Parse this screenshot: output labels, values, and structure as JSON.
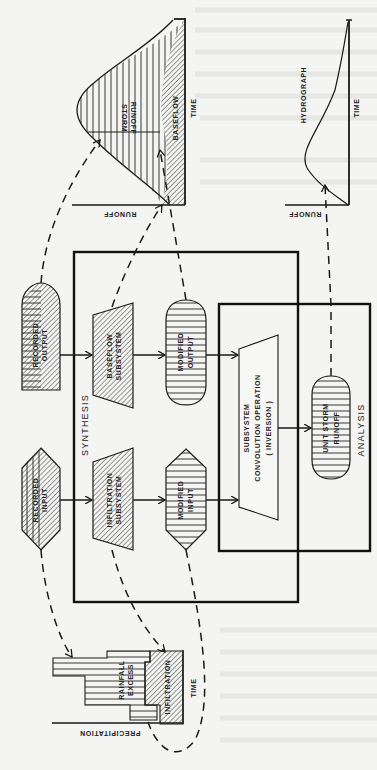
{
  "diagram": {
    "type": "flow diagram (rotated 90° clockwise)",
    "orientation": "rotated-90-cw",
    "colors": {
      "ink": "#1a1a1a",
      "paper": "#f4f4f2",
      "bleed_text": "#d8d8d4"
    },
    "groups": {
      "synthesis": {
        "label": "SYNTHESIS"
      },
      "analysis": {
        "label": "ANALYSIS"
      }
    },
    "nodes": {
      "recorded_output": {
        "line1": "RECORDED",
        "line2": "OUTPUT",
        "shape": "capsule",
        "fill": "horizontal lines + diagonal hatch"
      },
      "recorded_input": {
        "line1": "RECORDED",
        "line2": "INPUT",
        "shape": "hexagon",
        "fill": "vertical lines + diagonal hatch"
      },
      "baseflow_subsystem": {
        "line1": "BASEFLOW",
        "line2": "SUBSYSTEM",
        "shape": "trapezoid",
        "fill": "diagonal hatch"
      },
      "infiltration_subsystem": {
        "line1": "INFILTRATION",
        "line2": "SUBSYSTEM",
        "shape": "trapezoid",
        "fill": "diagonal hatch"
      },
      "modified_output": {
        "line1": "MODIFIED",
        "line2": "OUTPUT",
        "shape": "capsule",
        "fill": "horizontal lines"
      },
      "modified_input": {
        "line1": "MODIFIED",
        "line2": "INPUT",
        "shape": "hexagon",
        "fill": "horizontal lines"
      },
      "convolution": {
        "line1": "SUBSYSTEM",
        "line2": "CONVOLUTION OPERATION",
        "line3": "( INVERSION )",
        "shape": "trapezoid"
      },
      "unit_storm_runoff": {
        "line1": "UNIT STORM",
        "line2": "RUNOFF",
        "shape": "capsule",
        "fill": "horizontal lines"
      }
    },
    "edges": [
      {
        "from": "recorded_output",
        "to": "baseflow_subsystem",
        "style": "solid-arrow"
      },
      {
        "from": "baseflow_subsystem",
        "to": "modified_output",
        "style": "solid-arrow"
      },
      {
        "from": "modified_output",
        "to": "convolution",
        "style": "solid-arrow"
      },
      {
        "from": "recorded_input",
        "to": "infiltration_subsystem",
        "style": "solid-arrow"
      },
      {
        "from": "infiltration_subsystem",
        "to": "modified_input",
        "style": "solid-arrow"
      },
      {
        "from": "modified_input",
        "to": "convolution",
        "style": "solid-arrow"
      },
      {
        "from": "convolution",
        "to": "unit_storm_runoff",
        "style": "solid-arrow"
      },
      {
        "from": "recorded_output",
        "to": "storm_hydrograph",
        "style": "dashed-arrow"
      },
      {
        "from": "baseflow_subsystem",
        "to": "storm_hydrograph.baseflow",
        "style": "dashed-arrow"
      },
      {
        "from": "modified_output",
        "to": "storm_hydrograph.storm_runoff",
        "style": "dashed-arrow"
      },
      {
        "from": "unit_storm_runoff",
        "to": "unit_hydrograph",
        "style": "dashed-arrow"
      },
      {
        "from": "recorded_input",
        "to": "precipitation_chart",
        "style": "dashed-arrow"
      },
      {
        "from": "infiltration_subsystem",
        "to": "precipitation_chart.infiltration",
        "style": "dashed-arrow"
      },
      {
        "from": "modified_input",
        "to": "precipitation_chart.rainfall_excess",
        "style": "dashed-arrow"
      }
    ],
    "plots": {
      "storm_hydrograph": {
        "y_axis": "RUNOFF",
        "x_axis": "TIME",
        "regions": [
          "STORM",
          "RUNOFF",
          "BASEFLOW"
        ]
      },
      "unit_hydrograph": {
        "y_axis": "RUNOFF",
        "x_axis": "TIME",
        "title": "HYDROGRAPH"
      },
      "precipitation_chart": {
        "y_axis": "PRECIPITATION",
        "x_axis": "TIME",
        "regions": [
          "RAINFALL",
          "EXCESS",
          "INFILTRATION"
        ]
      }
    }
  }
}
